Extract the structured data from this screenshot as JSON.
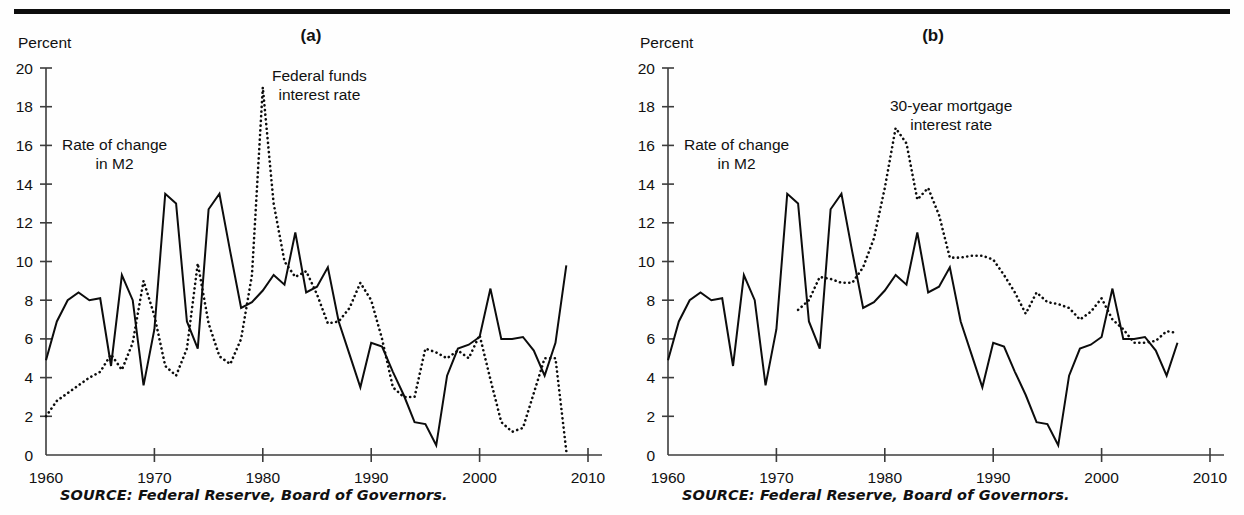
{
  "figure": {
    "top_rule": true,
    "source_note": "SOURCE: Federal Reserve, Board of Governors."
  },
  "panels": [
    {
      "letter": "(a)",
      "axis_title": "Percent",
      "m2_label": "Rate of change\nin M2",
      "rate_label": "Federal funds\ninterest rate",
      "source": "SOURCE: Federal Reserve, Board of Governors."
    },
    {
      "letter": "(b)",
      "axis_title": "Percent",
      "m2_label": "Rate of change\nin M2",
      "rate_label": "30-year mortgage\ninterest rate",
      "source": "SOURCE: Federal Reserve, Board of Governors."
    }
  ],
  "axis": {
    "y_ticks": [
      0,
      2,
      4,
      6,
      8,
      10,
      12,
      14,
      16,
      18,
      20
    ],
    "x_ticks": [
      1960,
      1970,
      1980,
      1990,
      2000,
      2010
    ],
    "ylim": [
      0,
      20
    ],
    "xlim": [
      1960,
      2010
    ],
    "ylabel": "Percent",
    "xlabel": ""
  },
  "chart_data": [
    {
      "type": "line",
      "title": "(a)",
      "ylabel": "Percent",
      "xlabel": "",
      "ylim": [
        0,
        20
      ],
      "xlim": [
        1960,
        2010
      ],
      "grid": false,
      "legend": "inline-annotations",
      "x": [
        1960,
        1961,
        1962,
        1963,
        1964,
        1965,
        1966,
        1967,
        1968,
        1969,
        1970,
        1971,
        1972,
        1973,
        1974,
        1975,
        1976,
        1977,
        1978,
        1979,
        1980,
        1981,
        1982,
        1983,
        1984,
        1985,
        1986,
        1987,
        1988,
        1989,
        1990,
        1991,
        1992,
        1993,
        1994,
        1995,
        1996,
        1997,
        1998,
        1999,
        2000,
        2001,
        2002,
        2003,
        2004,
        2005,
        2006,
        2007,
        2008
      ],
      "series": [
        {
          "name": "Rate of change in M2",
          "style": "solid",
          "values": [
            4.9,
            6.9,
            8.0,
            8.4,
            8.0,
            8.1,
            4.6,
            9.3,
            8.0,
            3.6,
            6.5,
            13.5,
            13.0,
            6.9,
            5.5,
            12.7,
            13.5,
            10.5,
            7.6,
            7.9,
            8.5,
            9.3,
            8.8,
            11.5,
            8.4,
            8.7,
            9.7,
            6.9,
            5.2,
            3.5,
            5.8,
            5.6,
            4.3,
            3.1,
            1.7,
            1.6,
            0.5,
            4.1,
            5.5,
            5.7,
            6.1,
            8.6,
            6.0,
            6.0,
            6.1,
            5.4,
            4.1,
            5.8,
            9.8
          ]
        },
        {
          "name": "Federal funds interest rate",
          "style": "dotted",
          "values": [
            2.0,
            2.8,
            3.2,
            3.6,
            4.0,
            4.3,
            5.2,
            4.4,
            5.8,
            9.0,
            7.2,
            4.6,
            4.1,
            5.5,
            9.9,
            6.8,
            5.1,
            4.7,
            6.0,
            9.3,
            19.0,
            13.0,
            10.0,
            9.2,
            9.5,
            8.3,
            6.8,
            6.9,
            7.6,
            8.9,
            8.0,
            6.0,
            3.5,
            3.0,
            3.0,
            5.5,
            5.3,
            5.0,
            5.4,
            5.0,
            6.2,
            3.9,
            1.7,
            1.2,
            1.4,
            3.2,
            5.0,
            5.0,
            0.2
          ]
        }
      ]
    },
    {
      "type": "line",
      "title": "(b)",
      "ylabel": "Percent",
      "xlabel": "",
      "ylim": [
        0,
        20
      ],
      "xlim": [
        1960,
        2010
      ],
      "grid": false,
      "legend": "inline-annotations",
      "x": [
        1960,
        1961,
        1962,
        1963,
        1964,
        1965,
        1966,
        1967,
        1968,
        1969,
        1970,
        1971,
        1972,
        1973,
        1974,
        1975,
        1976,
        1977,
        1978,
        1979,
        1980,
        1981,
        1982,
        1983,
        1984,
        1985,
        1986,
        1987,
        1988,
        1989,
        1990,
        1991,
        1992,
        1993,
        1994,
        1995,
        1996,
        1997,
        1998,
        1999,
        2000,
        2001,
        2002,
        2003,
        2004,
        2005,
        2006,
        2007
      ],
      "series": [
        {
          "name": "Rate of change in M2",
          "style": "solid",
          "values": [
            4.9,
            6.9,
            8.0,
            8.4,
            8.0,
            8.1,
            4.6,
            9.3,
            8.0,
            3.6,
            6.5,
            13.5,
            13.0,
            6.9,
            5.5,
            12.7,
            13.5,
            10.5,
            7.6,
            7.9,
            8.5,
            9.3,
            8.8,
            11.5,
            8.4,
            8.7,
            9.7,
            6.9,
            5.2,
            3.5,
            5.8,
            5.6,
            4.3,
            3.1,
            1.7,
            1.6,
            0.5,
            4.1,
            5.5,
            5.7,
            6.1,
            8.6,
            6.0,
            6.0,
            6.1,
            5.4,
            4.1,
            5.8,
            9.8
          ]
        },
        {
          "name": "30-year mortgage interest rate",
          "style": "dotted",
          "start_year": 1972,
          "values": [
            null,
            null,
            null,
            null,
            null,
            null,
            null,
            null,
            null,
            null,
            null,
            null,
            7.5,
            8.0,
            9.2,
            9.1,
            8.9,
            8.9,
            9.7,
            11.2,
            13.8,
            16.9,
            16.1,
            13.2,
            13.8,
            12.4,
            10.2,
            10.2,
            10.3,
            10.3,
            10.1,
            9.3,
            8.4,
            7.3,
            8.4,
            7.9,
            7.8,
            7.6,
            7.0,
            7.4,
            8.1,
            7.0,
            6.5,
            5.8,
            5.8,
            5.9,
            6.4,
            6.3,
            5.5
          ]
        }
      ]
    }
  ]
}
